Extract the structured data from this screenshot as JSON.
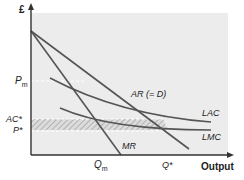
{
  "diagram": {
    "type": "economics-cost-revenue",
    "y_axis_label": "£",
    "x_axis_label": "Output",
    "curves": [
      {
        "id": "AR",
        "label": "AR (= D)"
      },
      {
        "id": "MR",
        "label": "MR"
      },
      {
        "id": "LAC",
        "label": "LAC"
      },
      {
        "id": "LMC",
        "label": "LMC"
      }
    ],
    "y_ticks": [
      {
        "label": "P",
        "sub": "m"
      },
      {
        "label": "AC*",
        "sub": ""
      },
      {
        "label": "P*",
        "sub": ""
      }
    ],
    "x_ticks": [
      {
        "label": "Q",
        "sub": "m"
      },
      {
        "label": "Q*",
        "sub": ""
      }
    ],
    "shaded_region": "loss area between AC* and P* (hatched)",
    "colors": {
      "panel": "#ececec",
      "curve": "#555555",
      "axis": "#333333",
      "hatch": "#b5b5b5"
    }
  }
}
